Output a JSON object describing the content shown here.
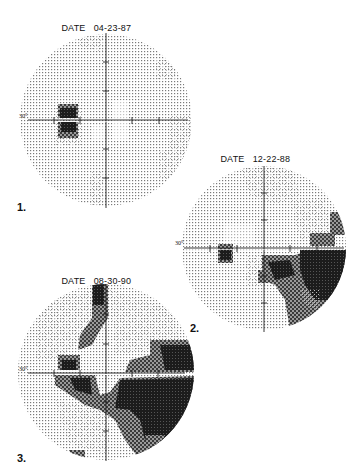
{
  "figure": {
    "panels": [
      {
        "number": "1.",
        "date_label": "DATE",
        "date": "04-23-87",
        "axis_label": "30°"
      },
      {
        "number": "2.",
        "date_label": "DATE",
        "date": "12-22-88",
        "axis_label": "30°"
      },
      {
        "number": "3.",
        "date_label": "DATE",
        "date": "08-30-90",
        "axis_label": "30°"
      }
    ],
    "colors": {
      "background": "#ffffff",
      "normal_dots": "#8a8a8a",
      "relative_defect": "#5a5a5a",
      "absolute_defect": "#1a1a1a",
      "axes": "#222222"
    }
  }
}
